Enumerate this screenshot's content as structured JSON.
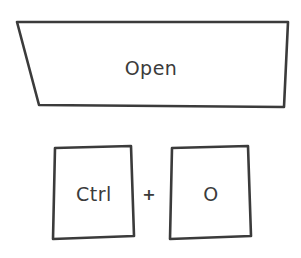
{
  "action": {
    "label": "Open"
  },
  "shortcut": {
    "keys": [
      {
        "label": "Ctrl"
      },
      {
        "label": "O"
      }
    ],
    "separator": "+"
  },
  "colors": {
    "stroke": "#3b3b3b",
    "background": "#ffffff"
  }
}
